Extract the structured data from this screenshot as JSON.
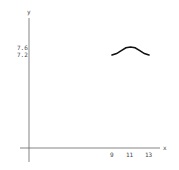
{
  "chart_data": {
    "type": "line",
    "title": "",
    "xlabel": "x",
    "ylabel": "y",
    "x_ticks": [
      "9",
      "11",
      "13"
    ],
    "y_ticks": [
      "7.6",
      "7.2"
    ],
    "series": [
      {
        "name": "curve",
        "x": [
          9,
          9.5,
          10,
          10.5,
          11,
          11.5,
          12,
          12.5,
          13
        ],
        "y": [
          7.2,
          7.27,
          7.42,
          7.56,
          7.6,
          7.56,
          7.42,
          7.27,
          7.2
        ]
      }
    ],
    "grid": false,
    "legend": "none"
  }
}
